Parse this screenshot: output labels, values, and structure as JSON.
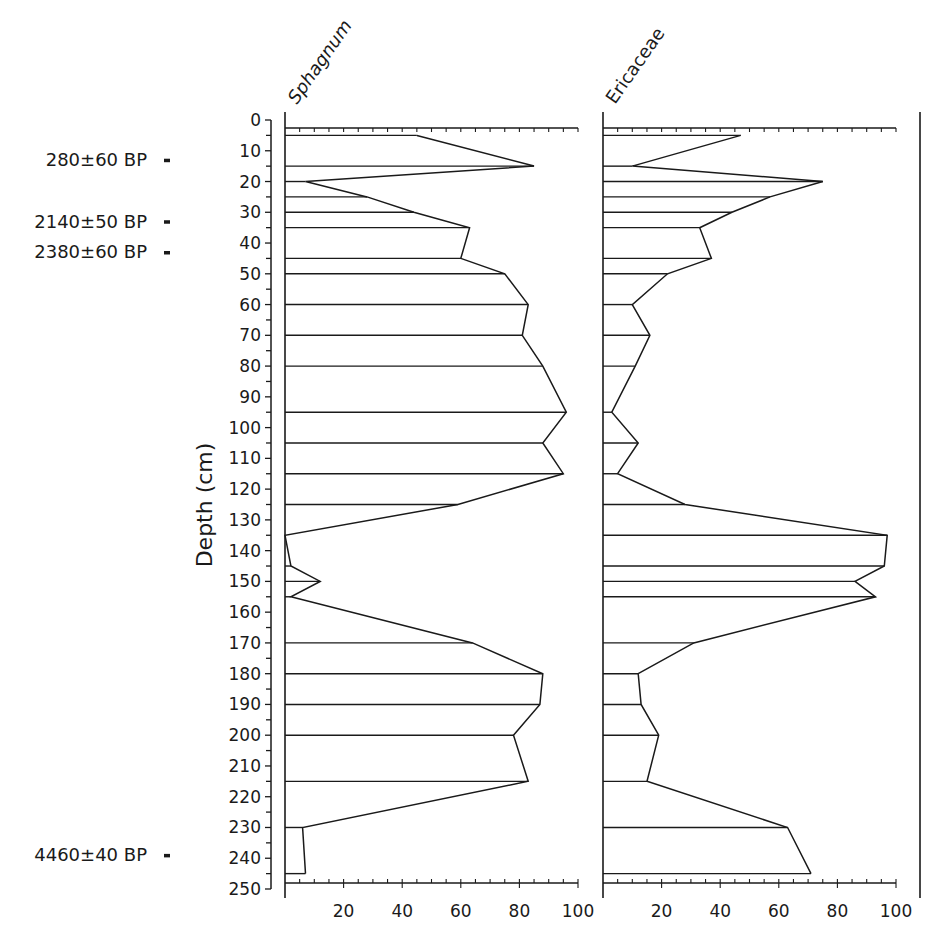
{
  "chart_data": {
    "type": "area",
    "orientation": "vertical-depth",
    "title": "",
    "ylabel": "Depth (cm)",
    "ylim": [
      0,
      250
    ],
    "y_ticks": [
      0,
      10,
      20,
      30,
      40,
      50,
      60,
      70,
      80,
      90,
      100,
      110,
      120,
      130,
      140,
      150,
      160,
      170,
      180,
      190,
      200,
      210,
      220,
      230,
      240,
      250
    ],
    "x_ticks": [
      20,
      40,
      60,
      80,
      100
    ],
    "xlim": [
      0,
      100
    ],
    "grid": false,
    "legend": null,
    "dates": [
      {
        "label": "280±60 BP",
        "depth": 16
      },
      {
        "label": "2140±50 BP",
        "depth": 36
      },
      {
        "label": "2380±60 BP",
        "depth": 46
      },
      {
        "label": "4460±40 BP",
        "depth": 242
      }
    ],
    "depths": [
      5,
      15,
      20,
      25,
      30,
      35,
      45,
      50,
      60,
      70,
      80,
      95,
      105,
      115,
      125,
      135,
      145,
      150,
      155,
      170,
      180,
      190,
      200,
      215,
      230,
      245
    ],
    "series": [
      {
        "name": "Sphagnum",
        "values": [
          45,
          85,
          7,
          28,
          44,
          63,
          60,
          75,
          83,
          81,
          88,
          96,
          88,
          95,
          59,
          0,
          2,
          12,
          2,
          64,
          88,
          87,
          78,
          83,
          6,
          7
        ]
      },
      {
        "name": "Ericaceae",
        "values": [
          47,
          10,
          75,
          57,
          44,
          33,
          37,
          22,
          10,
          16,
          11,
          3,
          12,
          5,
          28,
          97,
          96,
          86,
          93,
          31,
          12,
          13,
          19,
          15,
          63,
          71
        ]
      }
    ]
  },
  "labels": {
    "axis_title": "Depth (cm)",
    "panel1": "Sphagnum",
    "panel2": "Ericaceae"
  }
}
